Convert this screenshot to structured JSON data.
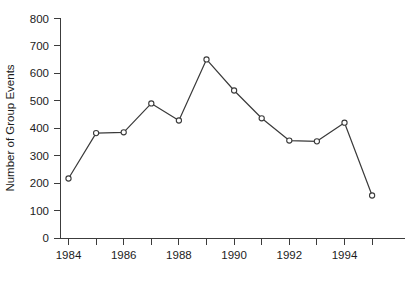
{
  "chart_data": {
    "type": "line",
    "title": "",
    "subtitle": "",
    "xlabel": "",
    "ylabel": "Number of Group Events",
    "x": [
      1984,
      1985,
      1986,
      1987,
      1988,
      1989,
      1990,
      1991,
      1992,
      1993,
      1994,
      1995
    ],
    "values": [
      218,
      383,
      386,
      491,
      429,
      651,
      538,
      437,
      356,
      353,
      421,
      156
    ],
    "series": [
      {
        "name": "Number of Group Events",
        "values": [
          218,
          383,
          386,
          491,
          429,
          651,
          538,
          437,
          356,
          353,
          421,
          156
        ]
      }
    ],
    "xlim": [
      1983.5,
      1995.5
    ],
    "ylim": [
      0,
      800
    ],
    "ytick_values": [
      0,
      100,
      200,
      300,
      400,
      500,
      600,
      700,
      800
    ],
    "ytick_labels": [
      "0",
      "100",
      "200",
      "300",
      "400",
      "500",
      "600",
      "700",
      "800"
    ],
    "xtick_values": [
      1984,
      1985,
      1986,
      1987,
      1988,
      1989,
      1990,
      1991,
      1992,
      1993,
      1994,
      1995
    ],
    "xtick_labels": [
      "1984",
      "",
      "1986",
      "",
      "1988",
      "",
      "1990",
      "",
      "1992",
      "",
      "1994",
      ""
    ],
    "xtick_labels_shown": [
      "1984",
      "1986",
      "1988",
      "1990",
      "1992",
      "1994"
    ],
    "grid": false,
    "legend": false,
    "legend_position": "none",
    "marker": "open-circle",
    "line_color": "#3a3a3a",
    "marker_face_color": "#ffffff",
    "marker_edge_color": "#3a3a3a",
    "background_color": "#ffffff",
    "axis_color": "#3c3c3c",
    "annotations": []
  },
  "axes": {
    "y_axis_title": "Number of Group Events"
  }
}
